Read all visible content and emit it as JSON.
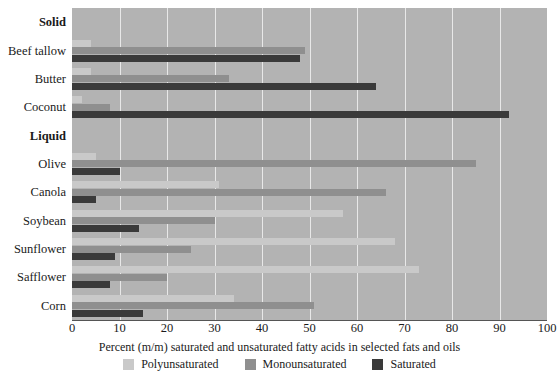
{
  "chart_data": {
    "type": "bar",
    "orientation": "horizontal",
    "title": "",
    "xlabel": "Percent (m/m) saturated and unsaturated fatty acids in selected fats and oils",
    "ylabel": "",
    "xlim": [
      0,
      100
    ],
    "grid": true,
    "legend_position": "bottom",
    "tick_labels": [
      "0",
      "10",
      "20",
      "30",
      "40",
      "50",
      "60",
      "70",
      "80",
      "90",
      "100"
    ],
    "tick_values": [
      0,
      10,
      20,
      30,
      40,
      50,
      60,
      70,
      80,
      90,
      100
    ],
    "group_headers": [
      "Solid",
      "Liquid"
    ],
    "categories": [
      "Beef tallow",
      "Butter",
      "Coconut",
      "Olive",
      "Canola",
      "Soybean",
      "Sunflower",
      "Safflower",
      "Corn"
    ],
    "series": [
      {
        "name": "Polyunsaturated",
        "color": "#c9c9c9",
        "values": [
          4,
          4,
          2,
          5,
          31,
          57,
          68,
          73,
          34
        ]
      },
      {
        "name": "Monounsaturated",
        "color": "#8f8f8f",
        "values": [
          49,
          33,
          8,
          85,
          66,
          30,
          25,
          20,
          51
        ]
      },
      {
        "name": "Saturated",
        "color": "#3a3a3a",
        "values": [
          48,
          64,
          92,
          10,
          5,
          14,
          9,
          8,
          15
        ]
      }
    ]
  },
  "legend": {
    "items": [
      {
        "label": "Polyunsaturated",
        "color": "#c9c9c9"
      },
      {
        "label": "Monounsaturated",
        "color": "#8f8f8f"
      },
      {
        "label": "Saturated",
        "color": "#3a3a3a"
      }
    ]
  },
  "colors": {
    "plot_background": "#b3b3b3",
    "gridline": "#e8e8e8",
    "axis": "#555555",
    "text": "#1a1a1a",
    "page_background": "#ffffff"
  }
}
